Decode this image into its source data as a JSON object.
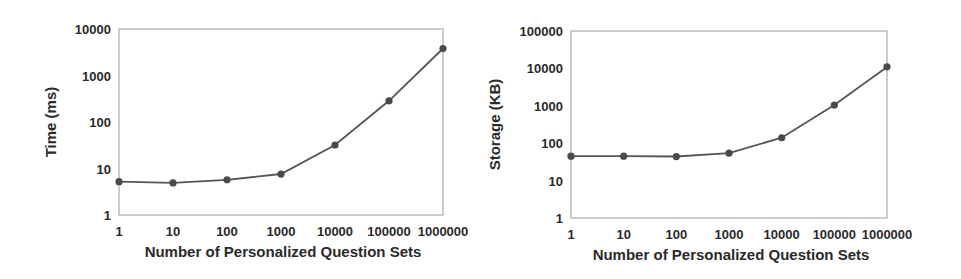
{
  "chart_data": [
    {
      "type": "line",
      "title": "",
      "xlabel": "Number of Personalized Question Sets",
      "ylabel": "Time (ms)",
      "x_scale": "log",
      "y_scale": "log",
      "x": [
        1,
        10,
        100,
        1000,
        10000,
        100000,
        1000000
      ],
      "x_tick_labels": [
        "1",
        "10",
        "100",
        "1000",
        "10000",
        "100000",
        "1000000"
      ],
      "y_tick_labels": [
        "1",
        "10",
        "100",
        "1000",
        "10000"
      ],
      "ylim": [
        1,
        10000
      ],
      "grid": false,
      "legend": null,
      "series": [
        {
          "name": "Time",
          "values": [
            5.2,
            4.9,
            5.7,
            7.6,
            32,
            285,
            3800
          ]
        }
      ]
    },
    {
      "type": "line",
      "title": "",
      "xlabel": "Number of Personalized Question Sets",
      "ylabel": "Storage (KB)",
      "x_scale": "log",
      "y_scale": "log",
      "x": [
        1,
        10,
        100,
        1000,
        10000,
        100000,
        1000000
      ],
      "x_tick_labels": [
        "1",
        "10",
        "100",
        "1000",
        "10000",
        "100000",
        "1000000"
      ],
      "y_tick_labels": [
        "1",
        "10",
        "100",
        "1000",
        "10000",
        "100000"
      ],
      "ylim": [
        1,
        100000
      ],
      "grid": false,
      "legend": null,
      "series": [
        {
          "name": "Storage",
          "values": [
            45,
            45,
            44,
            54,
            140,
            1050,
            11000
          ]
        }
      ]
    }
  ],
  "style": {
    "line_color": "#555555",
    "marker_color": "#4a4a4a",
    "frame_color": "#9a9a9a",
    "text_color": "#2a2a2a"
  }
}
